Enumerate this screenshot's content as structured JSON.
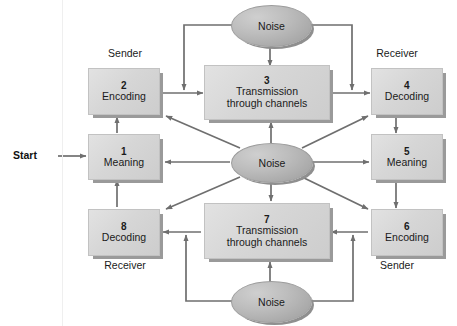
{
  "diagram": {
    "start_label": "Start",
    "colors": {
      "box_fill": "#d6d6d6",
      "box_shadow": "#9a9a9a",
      "ellipse_fill": "#b4b4b4",
      "arrow": "#6f6f6f",
      "text": "#1a1a1a",
      "background": "#ffffff"
    },
    "nodes": [
      {
        "id": "n1",
        "num": "1",
        "line1": "Meaning",
        "line2": ""
      },
      {
        "id": "n2",
        "num": "2",
        "line1": "Encoding",
        "line2": ""
      },
      {
        "id": "n3",
        "num": "3",
        "line1": "Transmission",
        "line2": "through channels"
      },
      {
        "id": "n4",
        "num": "4",
        "line1": "Decoding",
        "line2": ""
      },
      {
        "id": "n5",
        "num": "5",
        "line1": "Meaning",
        "line2": ""
      },
      {
        "id": "n6",
        "num": "6",
        "line1": "Encoding",
        "line2": ""
      },
      {
        "id": "n7",
        "num": "7",
        "line1": "Transmission",
        "line2": "through channels"
      },
      {
        "id": "n8",
        "num": "8",
        "line1": "Decoding",
        "line2": ""
      }
    ],
    "ellipses": [
      {
        "id": "noise-top",
        "label": "Noise"
      },
      {
        "id": "noise-center",
        "label": "Noise"
      },
      {
        "id": "noise-bottom",
        "label": "Noise"
      }
    ],
    "role_labels": [
      {
        "id": "sender-top",
        "text": "Sender"
      },
      {
        "id": "receiver-top",
        "text": "Receiver"
      },
      {
        "id": "receiver-bottom",
        "text": "Receiver"
      },
      {
        "id": "sender-bottom",
        "text": "Sender"
      }
    ]
  }
}
